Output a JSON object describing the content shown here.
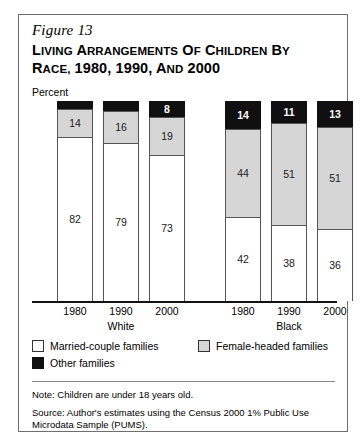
{
  "figure": {
    "number": "Figure 13",
    "title_line1_small_start": "L",
    "title": "LIVING ARRANGEMENTS OF CHILDREN BY RACE, 1980, 1990, AND 2000"
  },
  "axis": {
    "unit_label": "Percent"
  },
  "legend": {
    "items": [
      {
        "key": "married",
        "label": "Married-couple families",
        "color": "#ffffff"
      },
      {
        "key": "female",
        "label": "Female-headed families",
        "color": "#d6d6d6"
      },
      {
        "key": "other",
        "label": "Other families",
        "color": "#101010"
      }
    ]
  },
  "notes": {
    "note": "Note: Children are under 18 years old.",
    "source": "Source: Author's estimates using the Census 2000 1% Public Use Microdata Sample (PUMS)."
  },
  "chart_data": {
    "type": "bar",
    "subtype": "stacked-column",
    "title": "Living Arrangements of Children by Race, 1980, 1990, and 2000",
    "xlabel": "",
    "ylabel": "Percent",
    "ylim": [
      0,
      100
    ],
    "grid": false,
    "legend_position": "bottom-left",
    "groups": [
      "White",
      "Black"
    ],
    "categories": [
      "1980",
      "1990",
      "2000",
      "1980",
      "1990",
      "2000"
    ],
    "series": [
      {
        "name": "Married-couple families",
        "color": "#ffffff",
        "values": [
          82,
          79,
          73,
          42,
          38,
          36
        ]
      },
      {
        "name": "Female-headed families",
        "color": "#d6d6d6",
        "values": [
          14,
          16,
          19,
          44,
          51,
          51
        ]
      },
      {
        "name": "Other families",
        "color": "#101010",
        "values": [
          4,
          5,
          8,
          14,
          11,
          13
        ]
      }
    ],
    "bars": [
      {
        "group": "White",
        "year": "1980",
        "married": 82,
        "female": 14,
        "other": 4,
        "other_label_position": "above"
      },
      {
        "group": "White",
        "year": "1990",
        "married": 79,
        "female": 16,
        "other": 5,
        "other_label_position": "above"
      },
      {
        "group": "White",
        "year": "2000",
        "married": 73,
        "female": 19,
        "other": 8,
        "other_label_position": "inside"
      },
      {
        "group": "Black",
        "year": "1980",
        "married": 42,
        "female": 44,
        "other": 14,
        "other_label_position": "inside"
      },
      {
        "group": "Black",
        "year": "1990",
        "married": 38,
        "female": 51,
        "other": 11,
        "other_label_position": "inside"
      },
      {
        "group": "Black",
        "year": "2000",
        "married": 36,
        "female": 51,
        "other": 13,
        "other_label_position": "inside"
      }
    ]
  }
}
